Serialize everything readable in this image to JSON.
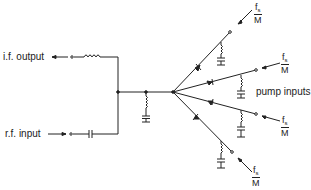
{
  "diagram": {
    "title": "",
    "labels": {
      "if_output": "i.f. output",
      "rf_input": "r.f. input",
      "pump_inputs": "pump inputs"
    },
    "pump_fraction": {
      "numerator": "f",
      "subscript": "s",
      "denominator": "M"
    },
    "pump_branch_count": 4,
    "colors": {
      "line": "#222222",
      "background": "#ffffff"
    }
  }
}
